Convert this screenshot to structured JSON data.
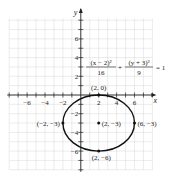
{
  "chart_data": {
    "type": "line",
    "title": "",
    "xlabel": "x",
    "ylabel": "y",
    "xlim": [
      -8,
      8
    ],
    "ylim": [
      -8,
      8
    ],
    "grid": true,
    "x_ticks": [
      -6,
      -4,
      -2,
      2,
      4,
      6
    ],
    "y_ticks": [
      6,
      4,
      2,
      -2,
      -4,
      -6
    ],
    "x_tick_labels": [
      "−6",
      "−4",
      "−2",
      "2",
      "4",
      "6"
    ],
    "y_tick_labels": [
      "6",
      "4",
      "2",
      "−2",
      "−4",
      "−6"
    ],
    "equation": {
      "term1_num": "(x − 2)²",
      "term1_den": "16",
      "plus": "+",
      "term2_num": "(y + 3)²",
      "term2_den": "9",
      "rhs": "= 1"
    },
    "ellipse": {
      "center": [
        2,
        -3
      ],
      "a": 4,
      "b": 3
    },
    "points": [
      {
        "x": 2,
        "y": 0,
        "label": "(2, 0)"
      },
      {
        "x": 2,
        "y": -3,
        "label": "(2, −3)"
      },
      {
        "x": -2,
        "y": -3,
        "label": "(−2, −3)"
      },
      {
        "x": 6,
        "y": -3,
        "label": "(6, −3)"
      },
      {
        "x": 2,
        "y": -6,
        "label": "(2, −6)"
      }
    ]
  },
  "colors": {
    "grid": "#d9d9d9",
    "axis": "#222222",
    "curve": "#111111"
  }
}
